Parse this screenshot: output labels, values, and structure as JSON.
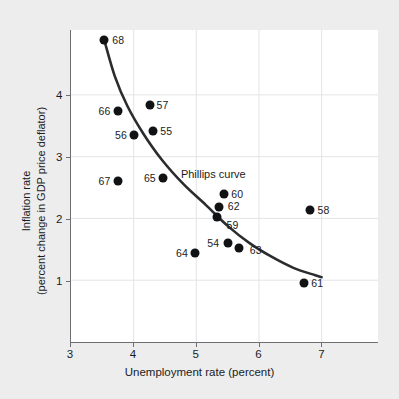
{
  "chart_data": {
    "type": "scatter",
    "title": "",
    "annotation": "Phillips curve",
    "xlabel": "Unemployment rate (percent)",
    "ylabel_line1": "Inflation rate",
    "ylabel_line2": "(percent change in GDP price deflator)",
    "xlim": [
      3,
      7.9
    ],
    "ylim": [
      0,
      5.05
    ],
    "xticks": [
      3,
      4,
      5,
      6,
      7
    ],
    "yticks": [
      1,
      2,
      3,
      4
    ],
    "xtick_labels": [
      "3",
      "4",
      "5",
      "6",
      "7"
    ],
    "ytick_labels": [
      "1",
      "2",
      "3",
      "4"
    ],
    "grid": true,
    "legend": "none",
    "point_color": "#111214",
    "curve_color": "#2b2c2e",
    "background_color": "#ededee",
    "plot_background_color": "#ffffff",
    "grid_color": "#e3e4e6",
    "points": [
      {
        "label": "68",
        "x": 3.53,
        "y": 4.89,
        "label_side": "right"
      },
      {
        "label": "66",
        "x": 3.74,
        "y": 3.75,
        "label_side": "left"
      },
      {
        "label": "57",
        "x": 4.25,
        "y": 3.84,
        "label_side": "right"
      },
      {
        "label": "56",
        "x": 4.0,
        "y": 3.35,
        "label_side": "left"
      },
      {
        "label": "55",
        "x": 4.31,
        "y": 3.42,
        "label_side": "right"
      },
      {
        "label": "67",
        "x": 3.74,
        "y": 2.61,
        "label_side": "left"
      },
      {
        "label": "65",
        "x": 4.46,
        "y": 2.67,
        "label_side": "left"
      },
      {
        "label": "60",
        "x": 5.44,
        "y": 2.41,
        "label_side": "right"
      },
      {
        "label": "62",
        "x": 5.35,
        "y": 2.19,
        "label_side": "right"
      },
      {
        "label": "59",
        "x": 5.33,
        "y": 2.03,
        "label_side": "right"
      },
      {
        "label": "58",
        "x": 6.81,
        "y": 2.14,
        "label_side": "right"
      },
      {
        "label": "54",
        "x": 5.5,
        "y": 1.61,
        "label_side": "left"
      },
      {
        "label": "63",
        "x": 5.67,
        "y": 1.54,
        "label_side": "right"
      },
      {
        "label": "64",
        "x": 4.97,
        "y": 1.46,
        "label_side": "left"
      },
      {
        "label": "61",
        "x": 6.71,
        "y": 0.97,
        "label_side": "right"
      }
    ],
    "curve_points": [
      {
        "x": 3.53,
        "y": 4.89
      },
      {
        "x": 3.7,
        "y": 4.3
      },
      {
        "x": 3.9,
        "y": 3.82
      },
      {
        "x": 4.15,
        "y": 3.38
      },
      {
        "x": 4.45,
        "y": 2.95
      },
      {
        "x": 4.8,
        "y": 2.55
      },
      {
        "x": 5.15,
        "y": 2.22
      },
      {
        "x": 5.5,
        "y": 1.88
      },
      {
        "x": 5.85,
        "y": 1.6
      },
      {
        "x": 6.2,
        "y": 1.38
      },
      {
        "x": 6.55,
        "y": 1.2
      },
      {
        "x": 6.9,
        "y": 1.08
      },
      {
        "x": 7.0,
        "y": 1.05
      }
    ]
  }
}
